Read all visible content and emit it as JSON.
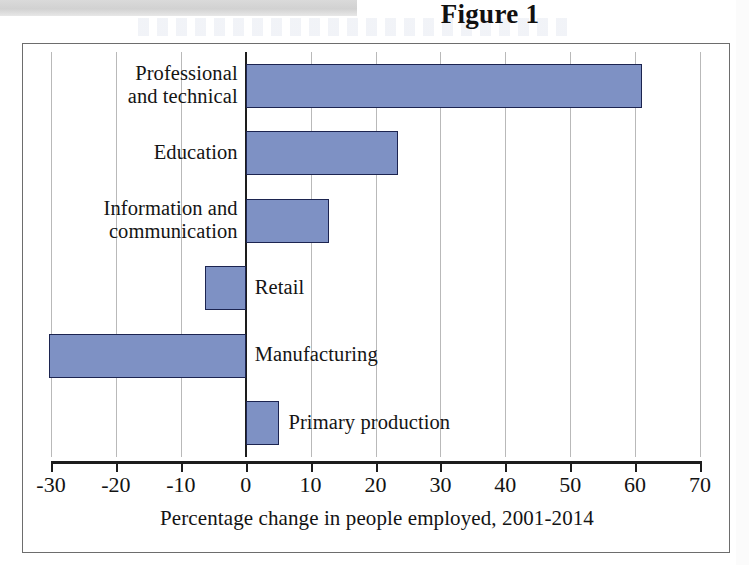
{
  "figure": {
    "title": "Figure 1"
  },
  "chart_data": {
    "type": "bar",
    "orientation": "horizontal",
    "title": "Figure 1",
    "xlabel": "Percentage change in people employed, 2001-2014",
    "ylabel": "",
    "xlim": [
      -30,
      70
    ],
    "xticks": [
      -30,
      -20,
      -10,
      0,
      10,
      20,
      30,
      40,
      50,
      60,
      70
    ],
    "xtick_labels": [
      "-30",
      "-20",
      "-10",
      "0",
      "10",
      "20",
      "30",
      "40",
      "50",
      "60",
      "70"
    ],
    "grid": true,
    "grid_axis": "x",
    "legend": false,
    "bar_fill_color": "#7e91c4",
    "bar_border_color": "#1c2450",
    "categories": [
      "Professional and technical",
      "Education",
      "Information and communication",
      "Retail",
      "Manufacturing",
      "Primary production"
    ],
    "values": [
      61,
      23.4,
      12.8,
      -6.2,
      -30.3,
      5.2
    ],
    "bars": [
      {
        "label": "Professional\nand technical",
        "label_side": "left",
        "value": 61
      },
      {
        "label": "Education",
        "label_side": "left",
        "value": 23.4
      },
      {
        "label": "Information and\ncommunication",
        "label_side": "left",
        "value": 12.8
      },
      {
        "label": "Retail",
        "label_side": "right",
        "value": -6.2
      },
      {
        "label": "Manufacturing",
        "label_side": "right",
        "value": -30.3
      },
      {
        "label": "Primary production",
        "label_side": "right",
        "value": 5.2
      }
    ]
  }
}
